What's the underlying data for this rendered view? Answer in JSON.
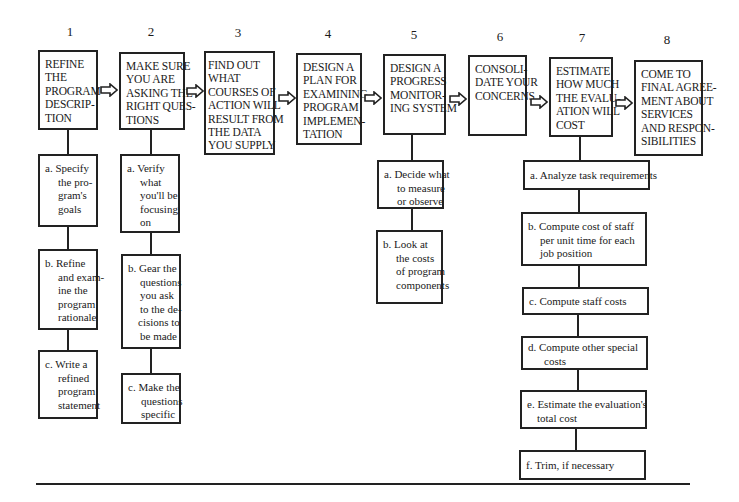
{
  "steps": [
    {
      "number": "1",
      "title_lines": [
        "REFINE",
        "THE",
        "PROGRAM",
        "DESCRIP-",
        "TION"
      ]
    },
    {
      "number": "2",
      "title_lines": [
        "MAKE SURE",
        "YOU ARE",
        "ASKING THE",
        "RIGHT QUES-",
        "TIONS"
      ]
    },
    {
      "number": "3",
      "title_lines": [
        "FIND OUT",
        "WHAT",
        "COURSES OF",
        "ACTION WILL",
        "RESULT FROM",
        "THE DATA",
        "YOU SUPPLY"
      ]
    },
    {
      "number": "4",
      "title_lines": [
        "DESIGN A",
        "PLAN FOR",
        "EXAMINING",
        "PROGRAM",
        "IMPLEMEN-",
        "TATION"
      ]
    },
    {
      "number": "5",
      "title_lines": [
        "DESIGN A",
        "PROGRESS",
        "MONITOR-",
        "ING SYSTEM"
      ]
    },
    {
      "number": "6",
      "title_lines": [
        "CONSOLI-",
        "DATE YOUR",
        "CONCERNS"
      ]
    },
    {
      "number": "7",
      "title_lines": [
        "ESTIMATE",
        "HOW MUCH",
        "THE EVALU-",
        "ATION WILL",
        "COST"
      ]
    },
    {
      "number": "8",
      "title_lines": [
        "COME TO",
        "FINAL AGREE-",
        "MENT ABOUT",
        "SERVICES",
        "AND RESPON-",
        "SIBILITIES"
      ]
    }
  ],
  "substeps": {
    "step1": [
      {
        "first": "a. Specify",
        "rest": [
          "the pro-",
          "gram's",
          "goals"
        ]
      },
      {
        "first": "b. Refine",
        "rest": [
          "and exam-",
          "ine the",
          "program",
          "rationale"
        ]
      },
      {
        "first": "c. Write a",
        "rest": [
          "refined",
          "program",
          "statement"
        ]
      }
    ],
    "step2": [
      {
        "first": "a. Verify",
        "rest": [
          "what",
          "you'll be",
          "focusing",
          "on"
        ]
      },
      {
        "first": "b. Gear the",
        "rest": [
          "questions",
          "you ask",
          "to the de-",
          "cisions to",
          "be made"
        ]
      },
      {
        "first": "c. Make the",
        "rest": [
          "questions",
          "specific"
        ]
      }
    ],
    "step5": [
      {
        "first": "a. Decide what",
        "rest": [
          "to measure",
          "or observe"
        ]
      },
      {
        "first": "b. Look at",
        "rest": [
          "the costs",
          "of program",
          "components"
        ]
      }
    ],
    "step7": [
      {
        "first": "a. Analyze task requirements",
        "rest": []
      },
      {
        "first": "b. Compute cost of staff",
        "rest": [
          "per unit time for each",
          "job position"
        ]
      },
      {
        "first": "c. Compute staff costs",
        "rest": []
      },
      {
        "first": "d. Compute other special",
        "rest": [
          "costs"
        ]
      },
      {
        "first": "e. Estimate the evaluation's",
        "rest": [
          "total cost"
        ]
      },
      {
        "first": "f. Trim, if necessary",
        "rest": []
      }
    ]
  },
  "arrow_icon": "hollow-right-arrow"
}
